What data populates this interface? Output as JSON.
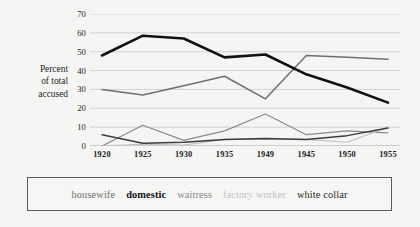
{
  "figure": {
    "title_sliver": "Percent of total accused",
    "y_axis_label_lines": [
      "Percent",
      "of total",
      "accused"
    ]
  },
  "chart_data": {
    "type": "line",
    "title": "",
    "xlabel": "",
    "ylabel": "Percent of total accused",
    "categories": [
      "1920",
      "1925",
      "1930",
      "1935",
      "1949",
      "1945",
      "1950",
      "1955"
    ],
    "x": [
      "1920",
      "1925",
      "1930",
      "1935",
      "1949",
      "1945",
      "1950",
      "1955"
    ],
    "ylim": [
      0,
      70
    ],
    "yticks": [
      0,
      10,
      20,
      30,
      40,
      50,
      60,
      70
    ],
    "ytick_labels": [
      "0",
      "10",
      "20",
      "30",
      "40",
      "50",
      "60",
      "70"
    ],
    "grid": true,
    "grid_axis": "y",
    "legend_position": "bottom",
    "series": [
      {
        "name": "housewife",
        "color": "#6f6f6f",
        "width": 1.5,
        "values": [
          30,
          27,
          32,
          37,
          25,
          48,
          47,
          46
        ]
      },
      {
        "name": "domestic",
        "color": "#111111",
        "width": 2.6,
        "values": [
          48,
          58.5,
          57,
          47,
          48.5,
          38,
          31,
          23
        ]
      },
      {
        "name": "waitress",
        "color": "#8a8a8a",
        "width": 1.2,
        "values": [
          0,
          11,
          3,
          8,
          17,
          6,
          8,
          7
        ]
      },
      {
        "name": "factory worker",
        "color": "#c2c2c2",
        "width": 1.2,
        "values": [
          0,
          1,
          0.5,
          3.5,
          3.5,
          3.5,
          2,
          10
        ]
      },
      {
        "name": "white collar",
        "color": "#3c3c3c",
        "width": 1.5,
        "values": [
          6,
          1.5,
          2,
          3.5,
          4,
          3.5,
          5.5,
          9.5
        ]
      }
    ]
  },
  "legend": {
    "items": [
      {
        "label": "housewife",
        "color": "#6f6f6f",
        "bold": false
      },
      {
        "label": "domestic",
        "color": "#111111",
        "bold": true
      },
      {
        "label": "waitress",
        "color": "#8a8a8a",
        "bold": false
      },
      {
        "label": "factory worker",
        "color": "#c2c2c2",
        "bold": false
      },
      {
        "label": "white collar",
        "color": "#2a2a2a",
        "bold": false
      }
    ]
  }
}
